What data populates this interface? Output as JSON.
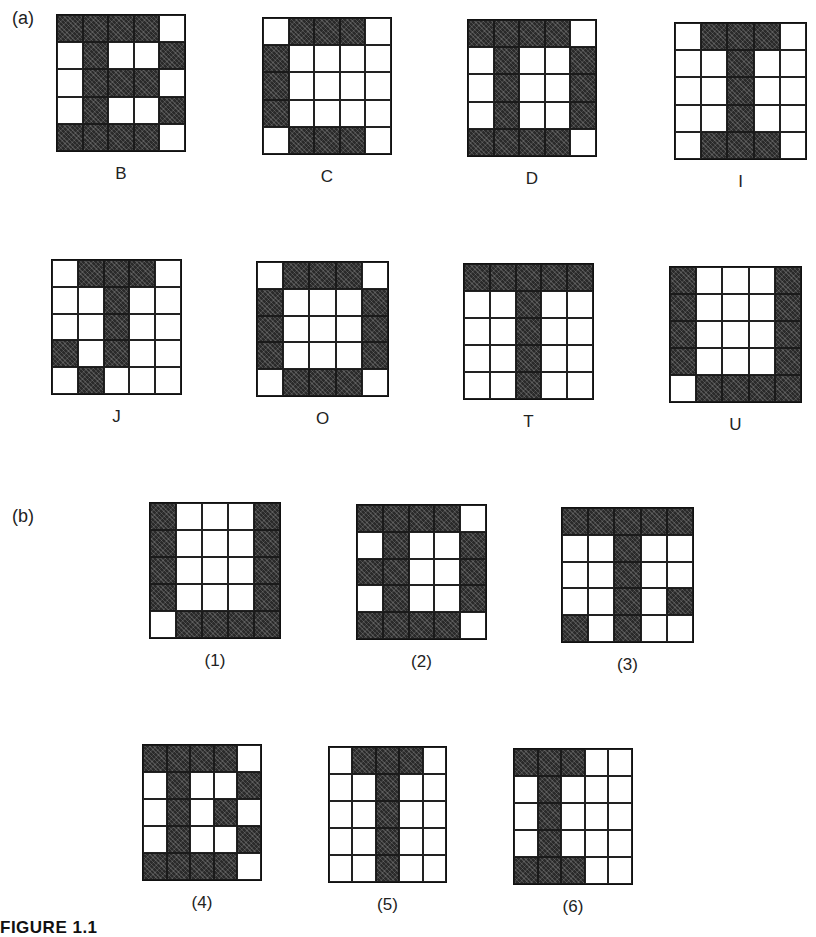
{
  "figure_title": "FIGURE 1.1",
  "sections": [
    {
      "label": "(a)",
      "label_pos": [
        12,
        10
      ],
      "patterns": [
        {
          "caption": "B",
          "x": 56,
          "y": 14,
          "w": 130,
          "h": 138,
          "cells": [
            [
              1,
              1,
              1,
              1,
              0
            ],
            [
              0,
              1,
              0,
              0,
              1
            ],
            [
              0,
              1,
              1,
              1,
              0
            ],
            [
              0,
              1,
              0,
              0,
              1
            ],
            [
              1,
              1,
              1,
              1,
              0
            ]
          ]
        },
        {
          "caption": "C",
          "x": 262,
          "y": 17,
          "w": 130,
          "h": 138,
          "cells": [
            [
              0,
              1,
              1,
              1,
              0
            ],
            [
              1,
              0,
              0,
              0,
              0
            ],
            [
              1,
              0,
              0,
              0,
              0
            ],
            [
              1,
              0,
              0,
              0,
              0
            ],
            [
              0,
              1,
              1,
              1,
              0
            ]
          ]
        },
        {
          "caption": "D",
          "x": 467,
          "y": 19,
          "w": 130,
          "h": 138,
          "cells": [
            [
              1,
              1,
              1,
              1,
              0
            ],
            [
              0,
              1,
              0,
              0,
              1
            ],
            [
              0,
              1,
              0,
              0,
              1
            ],
            [
              0,
              1,
              0,
              0,
              1
            ],
            [
              1,
              1,
              1,
              1,
              0
            ]
          ]
        },
        {
          "caption": "I",
          "x": 674,
          "y": 22,
          "w": 133,
          "h": 138,
          "cells": [
            [
              0,
              1,
              1,
              1,
              0
            ],
            [
              0,
              0,
              1,
              0,
              0
            ],
            [
              0,
              0,
              1,
              0,
              0
            ],
            [
              0,
              0,
              1,
              0,
              0
            ],
            [
              0,
              1,
              1,
              1,
              0
            ]
          ]
        }
      ]
    },
    {
      "label": "",
      "label_pos": [
        0,
        0
      ],
      "patterns": [
        {
          "caption": "J",
          "x": 51,
          "y": 259,
          "w": 131,
          "h": 136,
          "cells": [
            [
              0,
              1,
              1,
              1,
              0
            ],
            [
              0,
              0,
              1,
              0,
              0
            ],
            [
              0,
              0,
              1,
              0,
              0
            ],
            [
              1,
              0,
              1,
              0,
              0
            ],
            [
              0,
              1,
              0,
              0,
              0
            ]
          ]
        },
        {
          "caption": "O",
          "x": 256,
          "y": 261,
          "w": 133,
          "h": 136,
          "cells": [
            [
              0,
              1,
              1,
              1,
              0
            ],
            [
              1,
              0,
              0,
              0,
              1
            ],
            [
              1,
              0,
              0,
              0,
              1
            ],
            [
              1,
              0,
              0,
              0,
              1
            ],
            [
              0,
              1,
              1,
              1,
              0
            ]
          ]
        },
        {
          "caption": "T",
          "x": 463,
          "y": 263,
          "w": 131,
          "h": 137,
          "cells": [
            [
              1,
              1,
              1,
              1,
              1
            ],
            [
              0,
              0,
              1,
              0,
              0
            ],
            [
              0,
              0,
              1,
              0,
              0
            ],
            [
              0,
              0,
              1,
              0,
              0
            ],
            [
              0,
              0,
              1,
              0,
              0
            ]
          ]
        },
        {
          "caption": "U",
          "x": 669,
          "y": 266,
          "w": 133,
          "h": 137,
          "cells": [
            [
              1,
              0,
              0,
              0,
              1
            ],
            [
              1,
              0,
              0,
              0,
              1
            ],
            [
              1,
              0,
              0,
              0,
              1
            ],
            [
              1,
              0,
              0,
              0,
              1
            ],
            [
              0,
              1,
              1,
              1,
              1
            ]
          ]
        }
      ]
    },
    {
      "label": "(b)",
      "label_pos": [
        12,
        508
      ],
      "patterns": [
        {
          "caption": "(1)",
          "x": 149,
          "y": 502,
          "w": 132,
          "h": 137,
          "cells": [
            [
              1,
              0,
              0,
              0,
              1
            ],
            [
              1,
              0,
              0,
              0,
              1
            ],
            [
              1,
              0,
              0,
              0,
              1
            ],
            [
              1,
              0,
              0,
              0,
              1
            ],
            [
              0,
              1,
              1,
              1,
              1
            ]
          ]
        },
        {
          "caption": "(2)",
          "x": 356,
          "y": 504,
          "w": 131,
          "h": 136,
          "cells": [
            [
              1,
              1,
              1,
              1,
              0
            ],
            [
              0,
              1,
              0,
              0,
              1
            ],
            [
              1,
              1,
              0,
              0,
              1
            ],
            [
              0,
              1,
              0,
              0,
              1
            ],
            [
              1,
              1,
              1,
              1,
              0
            ]
          ]
        },
        {
          "caption": "(3)",
          "x": 561,
          "y": 507,
          "w": 133,
          "h": 136,
          "cells": [
            [
              1,
              1,
              1,
              1,
              1
            ],
            [
              0,
              0,
              1,
              0,
              0
            ],
            [
              0,
              0,
              1,
              0,
              0
            ],
            [
              0,
              0,
              1,
              0,
              1
            ],
            [
              1,
              0,
              1,
              0,
              0
            ]
          ]
        }
      ]
    },
    {
      "label": "",
      "label_pos": [
        0,
        0
      ],
      "patterns": [
        {
          "caption": "(4)",
          "x": 142,
          "y": 744,
          "w": 120,
          "h": 137,
          "cells": [
            [
              1,
              1,
              1,
              1,
              0
            ],
            [
              0,
              1,
              0,
              0,
              1
            ],
            [
              0,
              1,
              0,
              1,
              0
            ],
            [
              0,
              1,
              0,
              0,
              1
            ],
            [
              1,
              1,
              1,
              1,
              0
            ]
          ]
        },
        {
          "caption": "(5)",
          "x": 328,
          "y": 746,
          "w": 119,
          "h": 137,
          "cells": [
            [
              0,
              1,
              1,
              1,
              0
            ],
            [
              0,
              0,
              1,
              0,
              0
            ],
            [
              0,
              0,
              1,
              0,
              0
            ],
            [
              0,
              0,
              1,
              0,
              0
            ],
            [
              0,
              0,
              1,
              0,
              0
            ]
          ]
        },
        {
          "caption": "(6)",
          "x": 513,
          "y": 748,
          "w": 120,
          "h": 137,
          "cells": [
            [
              1,
              1,
              1,
              0,
              0
            ],
            [
              0,
              1,
              0,
              0,
              0
            ],
            [
              0,
              1,
              0,
              0,
              0
            ],
            [
              0,
              1,
              0,
              0,
              0
            ],
            [
              1,
              1,
              1,
              0,
              0
            ]
          ]
        }
      ]
    }
  ]
}
